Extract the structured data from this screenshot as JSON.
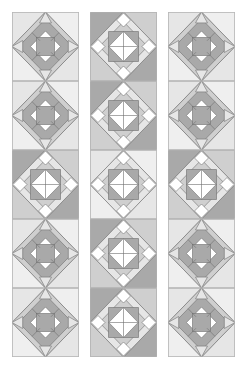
{
  "colors": {
    "background": "#ffffff",
    "light": "#e6e6e6",
    "lighter": "#efefef",
    "medium": "#cfcfcf",
    "dark": "#a9a9a9",
    "darker": "#9a9a9a",
    "white": "#ffffff",
    "line": "#6f6f6f"
  },
  "columns": [
    {
      "x": 12,
      "blocks": [
        "ring",
        "ring",
        "star",
        "ring",
        "ring"
      ],
      "corner_shade": [
        "light",
        "light",
        "dark",
        "light",
        "light"
      ]
    },
    {
      "x": 90,
      "blocks": [
        "star",
        "star",
        "star",
        "star",
        "star"
      ],
      "corner_shade": [
        "dark",
        "dark",
        "light",
        "dark",
        "dark"
      ]
    },
    {
      "x": 168,
      "blocks": [
        "ring",
        "ring",
        "star",
        "ring",
        "ring"
      ],
      "corner_shade": [
        "light",
        "light",
        "dark",
        "light",
        "light"
      ]
    }
  ],
  "block_size": {
    "w": 67,
    "h": 69
  },
  "rows": 5
}
